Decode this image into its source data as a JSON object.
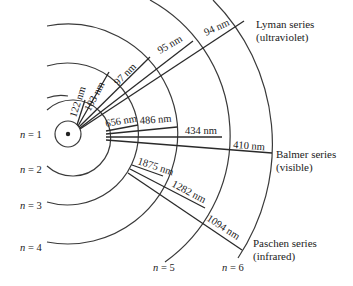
{
  "diagram": {
    "nucleus": {
      "cx": 68,
      "cy": 134
    },
    "levels": [
      {
        "n": 1,
        "label_var": "n",
        "label_eq": " = 1",
        "radius": 13
      },
      {
        "n": 2,
        "label_var": "n",
        "label_eq": " = 2",
        "radius": 38
      },
      {
        "n": 3,
        "label_var": "n",
        "label_eq": " = 3",
        "radius": 71
      },
      {
        "n": 4,
        "label_var": "n",
        "label_eq": " = 4",
        "radius": 110
      },
      {
        "n": 5,
        "label_var": "n",
        "label_eq": " = 5",
        "radius": 155
      },
      {
        "n": 6,
        "label_var": "n",
        "label_eq": " = 6",
        "radius": 205
      }
    ],
    "series": [
      {
        "name": "Lyman series",
        "region": "(ultraviolet)",
        "lower_level": 1,
        "transitions": [
          {
            "from": 2,
            "wavelength": "122 nm"
          },
          {
            "from": 3,
            "wavelength": "103 nm"
          },
          {
            "from": 4,
            "wavelength": "97 nm"
          },
          {
            "from": 5,
            "wavelength": "95 nm"
          },
          {
            "from": 6,
            "wavelength": "94 nm"
          }
        ]
      },
      {
        "name": "Balmer series",
        "region": "(visible)",
        "lower_level": 2,
        "transitions": [
          {
            "from": 3,
            "wavelength": "656 nm"
          },
          {
            "from": 4,
            "wavelength": "486 nm"
          },
          {
            "from": 5,
            "wavelength": "434 nm"
          },
          {
            "from": 6,
            "wavelength": "410 nm"
          }
        ]
      },
      {
        "name": "Paschen series",
        "region": "(infrared)",
        "lower_level": 3,
        "transitions": [
          {
            "from": 4,
            "wavelength": "1875 nm"
          },
          {
            "from": 5,
            "wavelength": "1282 nm"
          },
          {
            "from": 6,
            "wavelength": "1094 nm"
          }
        ]
      }
    ]
  }
}
